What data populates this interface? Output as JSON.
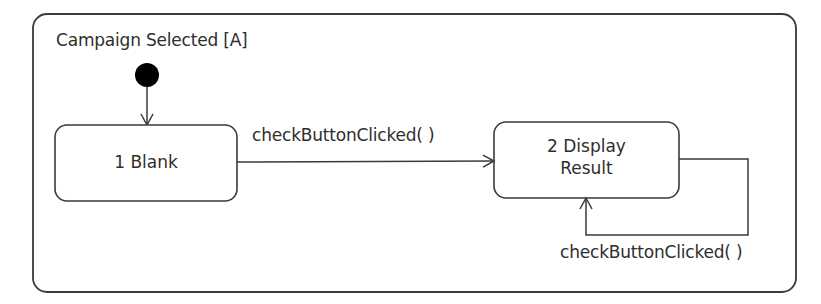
{
  "diagram": {
    "type": "UML state machine",
    "composite_state": {
      "label": "Campaign Selected [A]"
    },
    "initial_state": {
      "name": "initial"
    },
    "states": [
      {
        "id": "blank",
        "line1": "1 Blank",
        "line2": ""
      },
      {
        "id": "display_result",
        "line1": "2 Display",
        "line2": "Result"
      }
    ],
    "transitions": [
      {
        "from": "initial",
        "to": "blank",
        "label": ""
      },
      {
        "from": "blank",
        "to": "display_result",
        "label": "checkButtonClicked( )"
      },
      {
        "from": "display_result",
        "to": "display_result",
        "label": "checkButtonClicked( )"
      }
    ],
    "colors": {
      "stroke": "#3a3a3a",
      "fill": "#ffffff",
      "initial": "#000000"
    }
  }
}
